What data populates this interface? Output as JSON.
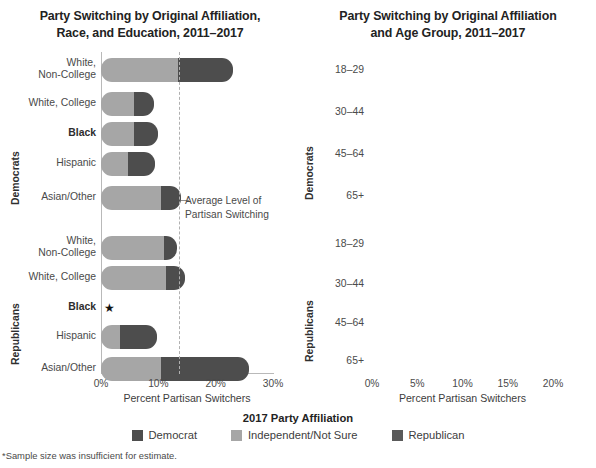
{
  "colors": {
    "democrat": "#4d4d4d",
    "independent": "#a6a6a6",
    "republican": "#5a5a5a",
    "axis": "#b9b9b9",
    "dashed": "#b0b0b0",
    "text": "#3b3b3b"
  },
  "legend": {
    "title": "2017 Party Affiliation",
    "items": [
      {
        "label": "Democrat",
        "color": "#4d4d4d",
        "key": "democrat"
      },
      {
        "label": "Independent/Not Sure",
        "color": "#a6a6a6",
        "key": "independent"
      },
      {
        "label": "Republican",
        "color": "#5a5a5a",
        "key": "republican"
      }
    ]
  },
  "footnote": "*Sample size was insufficient for estimate.",
  "charts": [
    {
      "id": "left",
      "title_line1": "Party Switching by Original Affiliation,",
      "title_line2": "Race, and Education, 2011–2017",
      "xlabel": "Percent Partisan Switchers",
      "xticks": [
        "0%",
        "10%",
        "20%",
        "30%"
      ],
      "xtick_values": [
        0,
        10,
        20,
        30
      ],
      "xlim": [
        0,
        30
      ],
      "avg_line_value": 13.6,
      "avg_note_line1": "Average Level of",
      "avg_note_line2": "Partisan Switching",
      "groups": [
        {
          "name": "Democrats",
          "rows": [
            {
              "label": "White,\nNon-College",
              "bold": false,
              "segments": [
                13.5,
                9.5
              ],
              "total": 23.0,
              "no_data": false
            },
            {
              "label": "White, College",
              "bold": false,
              "segments": [
                5.8,
                3.5
              ],
              "total": 9.3,
              "no_data": false
            },
            {
              "label": "Black",
              "bold": true,
              "segments": [
                5.8,
                4.2
              ],
              "total": 10.0,
              "no_data": false
            },
            {
              "label": "Hispanic",
              "bold": false,
              "segments": [
                4.7,
                4.8
              ],
              "total": 9.5,
              "no_data": false
            },
            {
              "label": "Asian/Other",
              "bold": false,
              "segments": [
                10.4,
                3.5
              ],
              "total": 13.9,
              "no_data": false
            }
          ]
        },
        {
          "name": "Republicans",
          "rows": [
            {
              "label": "White,\nNon-College",
              "bold": false,
              "segments": [
                11.0,
                2.3
              ],
              "total": 13.3,
              "no_data": false
            },
            {
              "label": "White, College",
              "bold": false,
              "segments": [
                11.4,
                3.3
              ],
              "total": 14.7,
              "no_data": false
            },
            {
              "label": "Black",
              "bold": true,
              "segments": [
                0,
                0
              ],
              "total": 0,
              "no_data": true,
              "marker": "★"
            },
            {
              "label": "Hispanic",
              "bold": false,
              "segments": [
                3.3,
                6.5
              ],
              "total": 9.8,
              "no_data": false
            },
            {
              "label": "Asian/Other",
              "bold": false,
              "segments": [
                10.4,
                15.4
              ],
              "total": 25.8,
              "no_data": false
            }
          ]
        }
      ]
    },
    {
      "id": "right",
      "title_line1": "Party Switching by Original Affiliation",
      "title_line2": "and Age Group, 2011–2017",
      "xlabel": "Percent Partisan Switchers",
      "xticks": [
        "0%",
        "5%",
        "10%",
        "15%",
        "20%"
      ],
      "xtick_values": [
        0,
        5,
        10,
        15,
        20
      ],
      "xlim": [
        0,
        20
      ],
      "avg_line_value": 13.8,
      "avg_note_line1": "Average Level",
      "avg_note_line2": "of Partisan",
      "avg_note_line3": "Switching",
      "groups": [
        {
          "name": "Democrats",
          "rows": [
            {
              "label": "18–29",
              "bold": false,
              "segments": [
                10.5,
                1.1
              ],
              "total": 11.6,
              "no_data": false
            },
            {
              "label": "30–44",
              "bold": false,
              "segments": [
                7.2,
                5.4
              ],
              "total": 12.6,
              "no_data": false
            },
            {
              "label": "45–64",
              "bold": false,
              "segments": [
                7.5,
                11.0
              ],
              "total": 18.5,
              "no_data": false
            },
            {
              "label": "65+",
              "bold": false,
              "segments": [
                6.7,
                10.9
              ],
              "total": 17.6,
              "no_data": false
            }
          ]
        },
        {
          "name": "Republicans",
          "rows": [
            {
              "label": "18–29",
              "bold": false,
              "segments": [
                17.4,
                1.8
              ],
              "total": 19.2,
              "no_data": false
            },
            {
              "label": "30–44",
              "bold": false,
              "segments": [
                11.4,
                4.0
              ],
              "total": 15.4,
              "no_data": false
            },
            {
              "label": "45–64",
              "bold": false,
              "segments": [
                9.6,
                3.4
              ],
              "total": 13.0,
              "no_data": false
            },
            {
              "label": "65+",
              "bold": false,
              "segments": [
                5.1,
                1.5
              ],
              "total": 6.6,
              "no_data": false
            }
          ]
        }
      ]
    }
  ],
  "chart_data": {
    "type": "bar",
    "orientation": "horizontal",
    "stacked": true,
    "panels": [
      {
        "title": "Party Switching by Original Affiliation, Race, and Education, 2011–2017",
        "xlabel": "Percent Partisan Switchers",
        "ylabel": "",
        "xlim": [
          0,
          30
        ],
        "xticks": [
          0,
          10,
          20,
          30
        ],
        "xticklabels": [
          "0%",
          "10%",
          "20%",
          "30%"
        ],
        "grid": false,
        "legend_position": "bottom",
        "annotation": {
          "label": "Average Level of Partisan Switching",
          "value": 13.6,
          "style": "dashed-vertical"
        },
        "categories": [
          "Democrats: White, Non-College",
          "Democrats: White, College",
          "Democrats: Black",
          "Democrats: Hispanic",
          "Democrats: Asian/Other",
          "Republicans: White, Non-College",
          "Republicans: White, College",
          "Republicans: Black",
          "Republicans: Hispanic",
          "Republicans: Asian/Other"
        ],
        "series": [
          {
            "name": "Independent/Not Sure",
            "values": [
              13.5,
              5.8,
              5.8,
              4.7,
              10.4,
              11.0,
              11.4,
              null,
              3.3,
              10.4
            ]
          },
          {
            "name": "Switched Party",
            "values": [
              9.5,
              3.5,
              4.2,
              4.8,
              3.5,
              2.3,
              3.3,
              null,
              6.5,
              15.4
            ]
          }
        ],
        "totals": [
          23.0,
          9.3,
          10.0,
          9.5,
          13.9,
          13.3,
          14.7,
          null,
          9.8,
          25.8
        ],
        "notes": "Republicans: Black marked with * — sample size was insufficient for estimate."
      },
      {
        "title": "Party Switching by Original Affiliation and Age Group, 2011–2017",
        "xlabel": "Percent Partisan Switchers",
        "ylabel": "",
        "xlim": [
          0,
          20
        ],
        "xticks": [
          0,
          5,
          10,
          15,
          20
        ],
        "xticklabels": [
          "0%",
          "5%",
          "10%",
          "15%",
          "20%"
        ],
        "grid": false,
        "legend_position": "bottom",
        "annotation": {
          "label": "Average Level of Partisan Switching",
          "value": 13.8,
          "style": "dashed-vertical"
        },
        "categories": [
          "Democrats: 18–29",
          "Democrats: 30–44",
          "Democrats: 45–64",
          "Democrats: 65+",
          "Republicans: 18–29",
          "Republicans: 30–44",
          "Republicans: 45–64",
          "Republicans: 65+"
        ],
        "series": [
          {
            "name": "Independent/Not Sure",
            "values": [
              10.5,
              7.2,
              7.5,
              6.7,
              17.4,
              11.4,
              9.6,
              5.1
            ]
          },
          {
            "name": "Switched Party",
            "values": [
              1.1,
              5.4,
              11.0,
              10.9,
              1.8,
              4.0,
              3.4,
              1.5
            ]
          }
        ],
        "totals": [
          11.6,
          12.6,
          18.5,
          17.6,
          19.2,
          15.4,
          13.0,
          6.6
        ]
      }
    ],
    "legend": [
      "Democrat",
      "Independent/Not Sure",
      "Republican"
    ],
    "footnote": "*Sample size was insufficient for estimate."
  }
}
